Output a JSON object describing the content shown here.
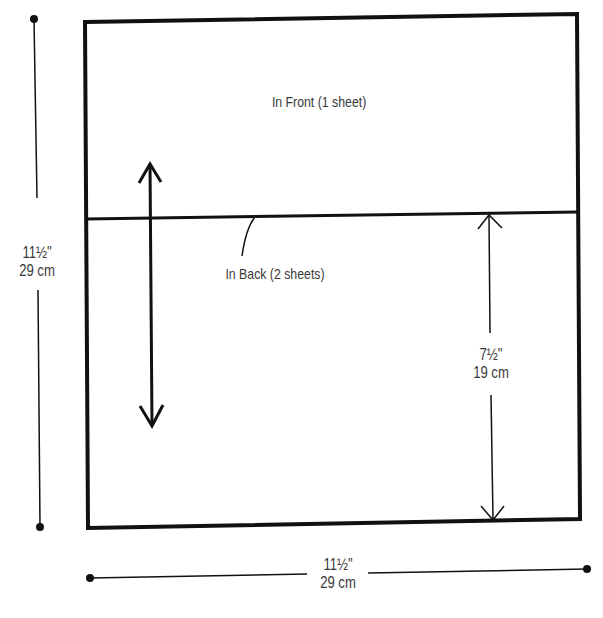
{
  "diagram": {
    "title": "",
    "regions": {
      "front": {
        "label": "In Front (1 sheet)"
      },
      "back": {
        "label": "In Back (2 sheets)"
      }
    },
    "dimensions": {
      "height": {
        "imperial": "11½\"",
        "metric": "29 cm"
      },
      "width": {
        "imperial": "11½\"",
        "metric": "29 cm"
      },
      "back_height": {
        "imperial": "7½\"",
        "metric": "19 cm"
      }
    },
    "colors": {
      "line": "#111111",
      "text": "#3a3a3a",
      "background": "#ffffff"
    }
  }
}
